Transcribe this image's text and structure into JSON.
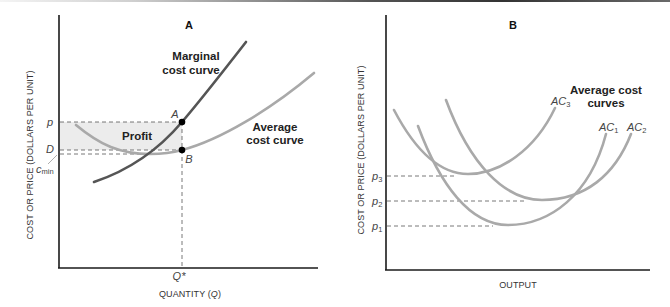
{
  "panels": [
    {
      "id": "A",
      "title": "A",
      "y_axis_label": "COST OR PRICE (DOLLARS PER UNIT)",
      "x_axis_label_prefix": "QUANTITY (",
      "x_axis_label_var": "Q",
      "x_axis_label_suffix": ")",
      "x_tick": "Q*",
      "y_ticks": {
        "p": "p",
        "D": "D",
        "cmin_base": "c",
        "cmin_sub": "min"
      },
      "points": {
        "A": "A",
        "B": "B"
      },
      "region_label": "Profit",
      "curve_labels": {
        "mc_line1": "Marginal",
        "mc_line2": "cost curve",
        "ac_line1": "Average",
        "ac_line2": "cost curve"
      },
      "colors": {
        "mc": "#555555",
        "ac": "#a9a9a9",
        "profit_fill": "#ececec"
      }
    },
    {
      "id": "B",
      "title": "B",
      "y_axis_label": "COST OR PRICE (DOLLARS PER UNIT)",
      "x_axis_label": "OUTPUT",
      "y_ticks": [
        {
          "base": "p",
          "sub": "3"
        },
        {
          "base": "p",
          "sub": "2"
        },
        {
          "base": "p",
          "sub": "1"
        }
      ],
      "group_label_line1": "Average cost",
      "group_label_line2": "curves",
      "curves": [
        {
          "base": "AC",
          "sub": "3"
        },
        {
          "base": "AC",
          "sub": "1"
        },
        {
          "base": "AC",
          "sub": "2"
        }
      ],
      "colors": {
        "ac": "#a9a9a9"
      }
    }
  ]
}
